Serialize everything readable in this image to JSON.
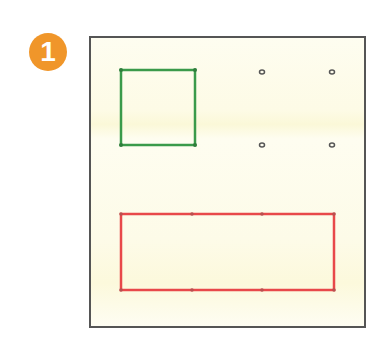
{
  "step": {
    "number": "1",
    "color": "#f0962a"
  },
  "frame": {
    "border_color": "#555555",
    "background": "#fdfbe6"
  },
  "shapes": {
    "green_square": {
      "color": "#3a9a4a"
    },
    "red_rectangle": {
      "color": "#e8484a"
    }
  },
  "dots": [
    {
      "x": 261,
      "y": 72
    },
    {
      "x": 332,
      "y": 72
    },
    {
      "x": 261,
      "y": 145
    },
    {
      "x": 332,
      "y": 145
    }
  ]
}
